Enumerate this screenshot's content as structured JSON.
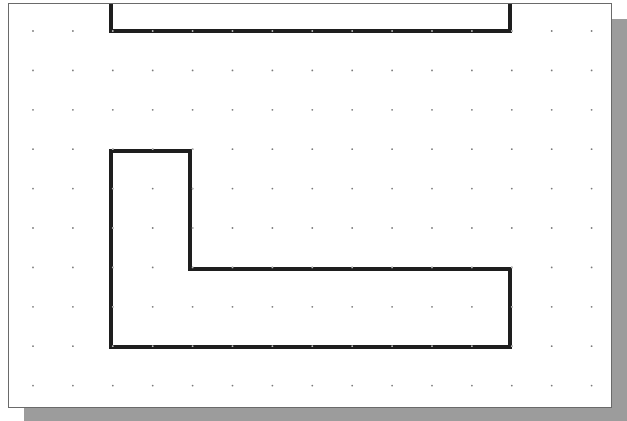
{
  "canvas": {
    "background": "#ffffff",
    "border_color": "#6a6a6a",
    "shadow_color": "#9c9c9c",
    "line_color": "#1e1e1e"
  },
  "grid": {
    "origin_x": 33,
    "origin_y": 31,
    "spacing_x": 39.9,
    "spacing_y": 39.4,
    "cols": 15,
    "rows": 10,
    "dot_color": "#7a7a7a"
  },
  "shapes": [
    {
      "name": "top-open-rectangle",
      "points": [
        [
          111,
          0
        ],
        [
          111,
          31
        ],
        [
          510,
          31
        ],
        [
          510,
          0
        ]
      ],
      "closed": false
    },
    {
      "name": "l-shape",
      "points": [
        [
          111,
          151
        ],
        [
          190,
          151
        ],
        [
          190,
          269
        ],
        [
          510,
          269
        ],
        [
          510,
          347
        ],
        [
          111,
          347
        ]
      ],
      "closed": true
    }
  ]
}
